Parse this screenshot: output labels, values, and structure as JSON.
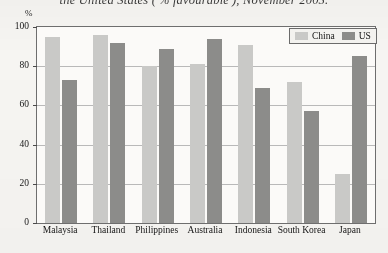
{
  "caption": "the United States ('% favourable'), November 2005.",
  "axis": {
    "unit_label": "%",
    "yticks": [
      0,
      20,
      40,
      60,
      80,
      100
    ]
  },
  "legend": {
    "items": [
      {
        "label": "China",
        "color": "#c9c9c7",
        "swatch": "china-swatch"
      },
      {
        "label": "US",
        "color": "#8c8c8a",
        "swatch": "us-swatch"
      }
    ]
  },
  "chart_data": {
    "type": "bar",
    "title": "the United States ('% favourable'), November 2005.",
    "xlabel": "",
    "ylabel": "%",
    "ylim": [
      0,
      100
    ],
    "grid": true,
    "legend_position": "top-right",
    "categories": [
      "Malaysia",
      "Thailand",
      "Philippines",
      "Australia",
      "Indonesia",
      "South Korea",
      "Japan"
    ],
    "series": [
      {
        "name": "China",
        "color": "#c9c9c7",
        "values": [
          95,
          96,
          80,
          81,
          91,
          72,
          25
        ]
      },
      {
        "name": "US",
        "color": "#8c8c8a",
        "values": [
          73,
          92,
          89,
          94,
          69,
          57,
          85
        ]
      }
    ]
  }
}
